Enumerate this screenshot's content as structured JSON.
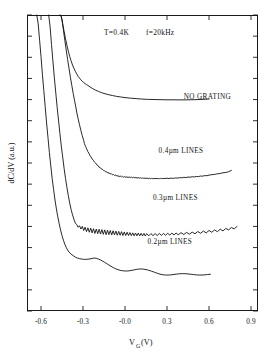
{
  "chart_data": {
    "type": "line",
    "title": "T=0.4K   f=20kHz",
    "title_parts": {
      "temperature": "T=0.4K",
      "frequency": "f=20kHz"
    },
    "xlabel_main": "V",
    "xlabel_sub": "G",
    "xlabel_unit": "(V)",
    "xlabel": "V_G (V)",
    "ylabel": "dC/dV (a.u.)",
    "xlim": [
      -0.7,
      0.95
    ],
    "ylim": [
      0,
      1
    ],
    "xticks": [
      -0.6,
      -0.3,
      -0.0,
      0.3,
      0.6,
      0.9
    ],
    "xtick_labels": [
      "-0.6",
      "-0.3",
      "-0.0",
      "0.3",
      "0.6",
      "0.9"
    ],
    "ytick_count": 14,
    "ytick_labels": [],
    "grid": false,
    "legend": "inline-annotations",
    "annotations": [
      {
        "text": "NO GRATING",
        "x": 0.42,
        "y": 0.715
      },
      {
        "text": "0.4µm LINES",
        "x": 0.24,
        "y": 0.535
      },
      {
        "text": "0.3µm LINES",
        "x": 0.2,
        "y": 0.375
      },
      {
        "text": "0.2µm LINES",
        "x": 0.16,
        "y": 0.225
      }
    ],
    "series": [
      {
        "name": "NO GRATING",
        "x": [
          -0.465,
          -0.455,
          -0.445,
          -0.435,
          -0.425,
          -0.415,
          -0.405,
          -0.395,
          -0.385,
          -0.375,
          -0.365,
          -0.355,
          -0.345,
          -0.335,
          -0.325,
          -0.315,
          -0.305,
          -0.295,
          -0.285,
          -0.275,
          -0.265,
          -0.25,
          -0.23,
          -0.21,
          -0.19,
          -0.17,
          -0.15,
          -0.12,
          -0.09,
          -0.06,
          -0.03,
          0.0,
          0.04,
          0.08,
          0.12,
          0.16,
          0.2,
          0.25,
          0.3,
          0.35,
          0.4,
          0.45,
          0.5,
          0.55,
          0.6
        ],
        "y": [
          1.02,
          0.995,
          0.97,
          0.945,
          0.92,
          0.898,
          0.878,
          0.86,
          0.845,
          0.831,
          0.82,
          0.81,
          0.801,
          0.793,
          0.787,
          0.781,
          0.776,
          0.772,
          0.768,
          0.765,
          0.762,
          0.757,
          0.751,
          0.746,
          0.742,
          0.738,
          0.735,
          0.731,
          0.728,
          0.725,
          0.723,
          0.721,
          0.719,
          0.7175,
          0.716,
          0.715,
          0.7145,
          0.714,
          0.7135,
          0.7135,
          0.7132,
          0.7135,
          0.714,
          0.7148,
          0.716
        ]
      },
      {
        "name": "0.4um LINES",
        "x": [
          -0.46,
          -0.45,
          -0.44,
          -0.43,
          -0.42,
          -0.41,
          -0.4,
          -0.39,
          -0.38,
          -0.37,
          -0.36,
          -0.35,
          -0.345,
          -0.335,
          -0.325,
          -0.315,
          -0.305,
          -0.295,
          -0.29,
          -0.282,
          -0.274,
          -0.266,
          -0.258,
          -0.25,
          -0.242,
          -0.234,
          -0.226,
          -0.218,
          -0.21,
          -0.202,
          -0.194,
          -0.186,
          -0.178,
          -0.17,
          -0.162,
          -0.154,
          -0.146,
          -0.138,
          -0.13,
          -0.122,
          -0.114,
          -0.106,
          -0.098,
          -0.09,
          -0.082,
          -0.074,
          -0.066,
          -0.058,
          -0.05,
          -0.042,
          -0.034,
          -0.026,
          -0.018,
          -0.01,
          -0.002,
          0.006,
          0.014,
          0.022,
          0.03,
          0.038,
          0.046,
          0.054,
          0.062,
          0.07,
          0.078,
          0.086,
          0.094,
          0.102,
          0.11,
          0.118,
          0.126,
          0.134,
          0.142,
          0.15,
          0.158,
          0.166,
          0.174,
          0.182,
          0.19,
          0.198,
          0.206,
          0.214,
          0.222,
          0.23,
          0.238,
          0.246,
          0.254,
          0.262,
          0.27,
          0.285,
          0.3,
          0.315,
          0.33,
          0.345,
          0.36,
          0.375,
          0.39,
          0.405,
          0.42,
          0.435,
          0.45,
          0.465,
          0.48,
          0.495,
          0.51,
          0.525,
          0.54,
          0.555,
          0.57,
          0.585,
          0.6,
          0.62,
          0.64,
          0.66,
          0.68,
          0.7,
          0.72,
          0.74,
          0.76
        ],
        "y": [
          1.02,
          0.985,
          0.95,
          0.915,
          0.882,
          0.85,
          0.82,
          0.79,
          0.762,
          0.735,
          0.71,
          0.686,
          0.672,
          0.65,
          0.629,
          0.61,
          0.592,
          0.576,
          0.566,
          0.556,
          0.548,
          0.539,
          0.533,
          0.525,
          0.52,
          0.513,
          0.509,
          0.503,
          0.5,
          0.494,
          0.492,
          0.486,
          0.485,
          0.48,
          0.479,
          0.475,
          0.474,
          0.47,
          0.47,
          0.466,
          0.467,
          0.463,
          0.464,
          0.46,
          0.461,
          0.458,
          0.459,
          0.456,
          0.457,
          0.454,
          0.456,
          0.453,
          0.455,
          0.452,
          0.454,
          0.452,
          0.453,
          0.451,
          0.453,
          0.451,
          0.452,
          0.45,
          0.452,
          0.45,
          0.451,
          0.449,
          0.451,
          0.449,
          0.45,
          0.448,
          0.45,
          0.448,
          0.449,
          0.448,
          0.449,
          0.447,
          0.449,
          0.447,
          0.448,
          0.447,
          0.448,
          0.447,
          0.448,
          0.447,
          0.448,
          0.447,
          0.448,
          0.447,
          0.448,
          0.4475,
          0.4485,
          0.4475,
          0.449,
          0.448,
          0.4495,
          0.449,
          0.4505,
          0.45,
          0.4515,
          0.451,
          0.4525,
          0.452,
          0.4535,
          0.453,
          0.4545,
          0.454,
          0.456,
          0.4555,
          0.4575,
          0.457,
          0.459,
          0.4605,
          0.4615,
          0.4635,
          0.4645,
          0.467,
          0.468,
          0.4705,
          0.475
        ]
      },
      {
        "name": "0.3um LINES",
        "x": [
          -0.545,
          -0.535,
          -0.525,
          -0.515,
          -0.505,
          -0.495,
          -0.485,
          -0.475,
          -0.465,
          -0.455,
          -0.445,
          -0.435,
          -0.425,
          -0.415,
          -0.405,
          -0.395,
          -0.385,
          -0.375,
          -0.365,
          -0.355,
          -0.345,
          -0.335,
          -0.325,
          -0.315,
          -0.305,
          -0.295,
          -0.285,
          -0.275,
          -0.265,
          -0.255,
          -0.245,
          -0.235,
          -0.225,
          -0.215,
          -0.205,
          -0.195,
          -0.185,
          -0.175,
          -0.165,
          -0.155,
          -0.145,
          -0.135,
          -0.125,
          -0.115,
          -0.105,
          -0.095,
          -0.085,
          -0.075,
          -0.065,
          -0.055,
          -0.045,
          -0.035,
          -0.025,
          -0.015,
          -0.005,
          0.005,
          0.015,
          0.025,
          0.035,
          0.045,
          0.055,
          0.065,
          0.075,
          0.085,
          0.095,
          0.105,
          0.115,
          0.125,
          0.135,
          0.145,
          0.155,
          0.17,
          0.185,
          0.2,
          0.215,
          0.23,
          0.245,
          0.26,
          0.275,
          0.29,
          0.305,
          0.32,
          0.335,
          0.35,
          0.365,
          0.38,
          0.4,
          0.42,
          0.44,
          0.46,
          0.48,
          0.5,
          0.52,
          0.54,
          0.56,
          0.58,
          0.6,
          0.62,
          0.64,
          0.66,
          0.68,
          0.7,
          0.72,
          0.74,
          0.76,
          0.78,
          0.8
        ],
        "y": [
          1.02,
          0.96,
          0.9,
          0.845,
          0.79,
          0.74,
          0.69,
          0.645,
          0.6,
          0.557,
          0.52,
          0.482,
          0.448,
          0.418,
          0.39,
          0.365,
          0.343,
          0.325,
          0.31,
          0.297,
          0.292,
          0.283,
          0.288,
          0.277,
          0.286,
          0.272,
          0.283,
          0.268,
          0.281,
          0.266,
          0.28,
          0.264,
          0.278,
          0.262,
          0.277,
          0.261,
          0.276,
          0.26,
          0.275,
          0.259,
          0.274,
          0.258,
          0.273,
          0.258,
          0.272,
          0.257,
          0.271,
          0.257,
          0.27,
          0.256,
          0.269,
          0.256,
          0.268,
          0.255,
          0.267,
          0.255,
          0.266,
          0.255,
          0.265,
          0.2545,
          0.264,
          0.254,
          0.2635,
          0.254,
          0.263,
          0.2538,
          0.2625,
          0.2536,
          0.262,
          0.2535,
          0.2615,
          0.254,
          0.2615,
          0.2545,
          0.2615,
          0.255,
          0.262,
          0.2555,
          0.262,
          0.256,
          0.2625,
          0.2565,
          0.263,
          0.257,
          0.2635,
          0.2575,
          0.2645,
          0.2585,
          0.2655,
          0.2595,
          0.2665,
          0.261,
          0.2685,
          0.2625,
          0.27,
          0.264,
          0.272,
          0.266,
          0.274,
          0.268,
          0.2765,
          0.2705,
          0.279,
          0.274,
          0.282,
          0.2775,
          0.2855
        ]
      },
      {
        "name": "0.2um LINES",
        "x": [
          -0.63,
          -0.62,
          -0.61,
          -0.6,
          -0.59,
          -0.58,
          -0.57,
          -0.56,
          -0.55,
          -0.54,
          -0.53,
          -0.52,
          -0.51,
          -0.5,
          -0.49,
          -0.48,
          -0.47,
          -0.46,
          -0.45,
          -0.44,
          -0.43,
          -0.42,
          -0.41,
          -0.4,
          -0.385,
          -0.37,
          -0.355,
          -0.34,
          -0.325,
          -0.31,
          -0.295,
          -0.28,
          -0.265,
          -0.25,
          -0.235,
          -0.22,
          -0.205,
          -0.19,
          -0.175,
          -0.16,
          -0.145,
          -0.13,
          -0.115,
          -0.1,
          -0.085,
          -0.07,
          -0.05,
          -0.03,
          -0.01,
          0.01,
          0.03,
          0.05,
          0.07,
          0.09,
          0.11,
          0.13,
          0.15,
          0.17,
          0.19,
          0.21,
          0.23,
          0.25,
          0.27,
          0.29,
          0.31,
          0.33,
          0.35,
          0.37,
          0.39,
          0.41,
          0.43,
          0.45,
          0.47,
          0.49,
          0.51,
          0.53,
          0.55,
          0.57,
          0.59,
          0.61
        ],
        "y": [
          1.02,
          0.97,
          0.915,
          0.86,
          0.8,
          0.745,
          0.69,
          0.635,
          0.585,
          0.535,
          0.49,
          0.447,
          0.41,
          0.375,
          0.345,
          0.318,
          0.295,
          0.273,
          0.255,
          0.239,
          0.226,
          0.215,
          0.206,
          0.199,
          0.192,
          0.187,
          0.182,
          0.179,
          0.177,
          0.1755,
          0.1745,
          0.1745,
          0.175,
          0.176,
          0.1775,
          0.179,
          0.178,
          0.1755,
          0.1725,
          0.1685,
          0.1645,
          0.16,
          0.1555,
          0.151,
          0.147,
          0.1435,
          0.1395,
          0.137,
          0.1355,
          0.135,
          0.1358,
          0.1375,
          0.1395,
          0.1412,
          0.142,
          0.1415,
          0.14,
          0.1375,
          0.1345,
          0.131,
          0.1275,
          0.1245,
          0.1225,
          0.1215,
          0.1215,
          0.1222,
          0.1235,
          0.1248,
          0.1258,
          0.1262,
          0.126,
          0.1252,
          0.1242,
          0.123,
          0.122,
          0.1215,
          0.1215,
          0.1222,
          0.1232,
          0.1242
        ]
      }
    ]
  },
  "plot": {
    "frame": {
      "left": 27,
      "top": 15,
      "right": 258,
      "bottom": 311
    }
  }
}
